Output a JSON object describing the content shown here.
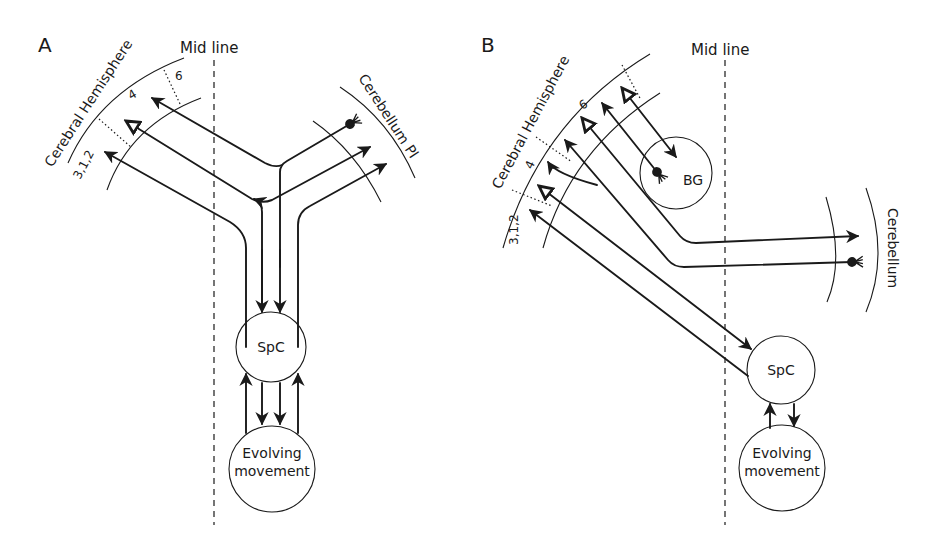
{
  "panels": [
    {
      "id": "A",
      "letter": "A",
      "midline_label": "Mid line",
      "cerebral_label": "Cerebral Hemisphere",
      "cerebellum_label": "Cerebellum Pl",
      "areas": [
        "3,1,2",
        "4",
        "6"
      ],
      "nodes": {
        "spc": "SpC",
        "evolving_1": "Evolving",
        "evolving_2": "movement"
      }
    },
    {
      "id": "B",
      "letter": "B",
      "midline_label": "Mid line",
      "cerebral_label": "Cerebral Hemisphere",
      "cerebellum_label": "Cerebellum",
      "areas": [
        "3,1,2",
        "4",
        "6"
      ],
      "nodes": {
        "bg": "BG",
        "spc": "SpC",
        "evolving_1": "Evolving",
        "evolving_2": "movement"
      }
    }
  ],
  "colors": {
    "ink": "#1a1a1a",
    "background": "#ffffff"
  }
}
